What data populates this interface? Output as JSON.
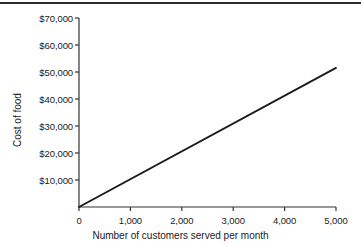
{
  "chart_data": {
    "type": "line",
    "title": "",
    "xlabel": "Number of customers served per month",
    "ylabel": "Cost of food",
    "xlim": [
      0,
      5000
    ],
    "ylim": [
      0,
      70000
    ],
    "grid": false,
    "legend": "none",
    "line_color": "#1a1a1a",
    "x_tick_labels": [
      "0",
      "1,000",
      "2,000",
      "3,000",
      "4,000",
      "5,000"
    ],
    "x_tick_values": [
      0,
      1000,
      2000,
      3000,
      4000,
      5000
    ],
    "y_tick_labels": [
      "$10,000",
      "$20,000",
      "$30,000",
      "$40,000",
      "$50,000",
      "$60,000",
      "$70,000"
    ],
    "y_tick_values": [
      10000,
      20000,
      30000,
      40000,
      50000,
      60000,
      70000
    ],
    "series": [
      {
        "name": "Cost of food",
        "x": [
          0,
          5000
        ],
        "values": [
          0,
          51500
        ]
      }
    ]
  }
}
